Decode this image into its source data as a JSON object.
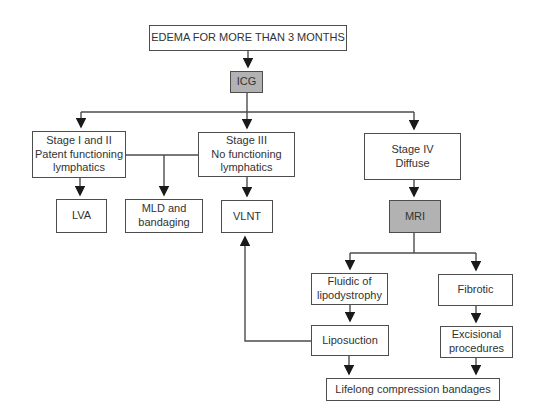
{
  "colors": {
    "background": "#ffffff",
    "node_fill": "#ffffff",
    "shaded_node_fill": "#b2b2b2",
    "node_border": "#4d4d4d",
    "connector": "#4c4c4c",
    "text": "#323232"
  },
  "flowchart": {
    "nodes": {
      "edema": {
        "label": "EDEMA FOR MORE THAN 3 MONTHS",
        "shaded": false
      },
      "icg": {
        "label": "ICG",
        "shaded": true
      },
      "stage_1_2": {
        "label": "Stage I and II\nPatent functioning\nlymphatics",
        "shaded": false
      },
      "stage_3": {
        "label": "Stage III\nNo functioning\nlymphatics",
        "shaded": false
      },
      "stage_4": {
        "label": "Stage IV\nDiffuse",
        "shaded": false
      },
      "lva": {
        "label": "LVA",
        "shaded": false
      },
      "mld": {
        "label": "MLD and\nbandaging",
        "shaded": false
      },
      "vlnt": {
        "label": "VLNT",
        "shaded": false
      },
      "mri": {
        "label": "MRI",
        "shaded": true
      },
      "fluidic": {
        "label": "Fluidic of\nlipodystrophy",
        "shaded": false
      },
      "fibrotic": {
        "label": "Fibrotic",
        "shaded": false
      },
      "liposuction": {
        "label": "Liposuction",
        "shaded": false
      },
      "excisional": {
        "label": "Excisional\nprocedures",
        "shaded": false
      },
      "lifelong": {
        "label": "Lifelong compression bandages",
        "shaded": false
      }
    },
    "edges": [
      {
        "from": "edema",
        "to": "icg",
        "arrow": true
      },
      {
        "from": "icg",
        "to": "stage_1_2",
        "arrow": true
      },
      {
        "from": "icg",
        "to": "stage_3",
        "arrow": true
      },
      {
        "from": "icg",
        "to": "stage_4",
        "arrow": true
      },
      {
        "from": "stage_1_2",
        "to": "lva",
        "arrow": true
      },
      {
        "from": "stage_1_2",
        "to": "stage_3",
        "arrow": false
      },
      {
        "from": "stage_1_2",
        "to": "mld",
        "arrow": true
      },
      {
        "from": "stage_3",
        "to": "vlnt",
        "arrow": true
      },
      {
        "from": "stage_4",
        "to": "mri",
        "arrow": true
      },
      {
        "from": "mri",
        "to": "fluidic",
        "arrow": true
      },
      {
        "from": "mri",
        "to": "fibrotic",
        "arrow": true
      },
      {
        "from": "fluidic",
        "to": "liposuction",
        "arrow": true
      },
      {
        "from": "fibrotic",
        "to": "excisional",
        "arrow": true
      },
      {
        "from": "liposuction",
        "to": "lifelong",
        "arrow": true
      },
      {
        "from": "excisional",
        "to": "lifelong",
        "arrow": true
      },
      {
        "from": "liposuction",
        "to": "vlnt",
        "arrow": true
      }
    ]
  }
}
